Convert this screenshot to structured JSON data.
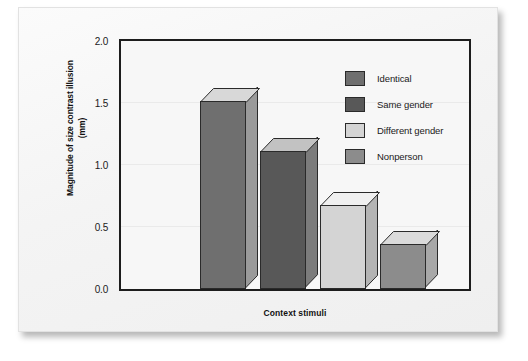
{
  "chart_data": {
    "type": "bar",
    "title": "",
    "xlabel": "Context stimuli",
    "ylabel": "Magnitude of size contrast illusion\n(mm)",
    "ylabel_line1": "Magnitude of size contrast illusion",
    "ylabel_line2": "(mm)",
    "categories": [
      "Identical",
      "Same gender",
      "Different gender",
      "Nonperson"
    ],
    "values": [
      1.52,
      1.11,
      0.68,
      0.36
    ],
    "ylim": [
      0.0,
      2.0
    ],
    "ytick_labels": [
      "2.0",
      "1.5",
      "1.0",
      "0.5",
      "0.0"
    ],
    "ytick_values": [
      2.0,
      1.5,
      1.0,
      0.5,
      0.0
    ],
    "grid": true,
    "legend_position": "top-right",
    "bar_colors": [
      "#6f6f6f",
      "#585858",
      "#d4d4d4",
      "#8c8c8c"
    ],
    "bar_top_colors": [
      "#d8d8d8",
      "#c2c2c2",
      "#f0f0f0",
      "#dadada"
    ],
    "bar_side_colors": [
      "#9a9a9a",
      "#7c7c7c",
      "#b4b4b4",
      "#a8a8a8"
    ],
    "legend": [
      {
        "label": "Identical",
        "color": "#6f6f6f"
      },
      {
        "label": "Same gender",
        "color": "#585858"
      },
      {
        "label": "Different gender",
        "color": "#d4d4d4"
      },
      {
        "label": "Nonperson",
        "color": "#8c8c8c"
      }
    ]
  },
  "figure": {
    "frame_color": "#1d1d1d",
    "plot_background": "#f7f7f7",
    "card_background": "#f4f4f4"
  }
}
